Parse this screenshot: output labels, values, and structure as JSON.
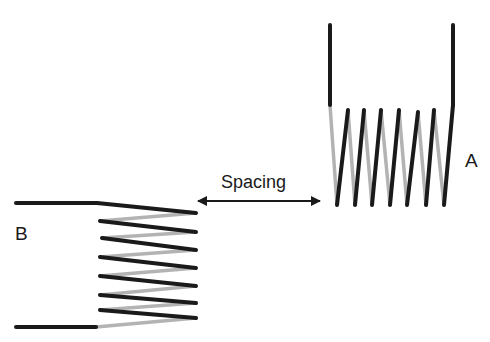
{
  "diagram": {
    "labels": {
      "coil_a": "A",
      "coil_b": "B",
      "spacing": "Spacing"
    },
    "colors": {
      "front_wire": "#1a1a1a",
      "back_wire": "#b3b3b3",
      "text": "#1a1a1a",
      "background": "#ffffff"
    },
    "coil_a": {
      "orientation": "vertical",
      "turns": 6
    },
    "coil_b": {
      "orientation": "horizontal",
      "turns": 6
    }
  }
}
